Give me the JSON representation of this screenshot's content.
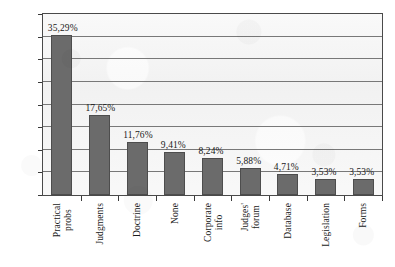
{
  "chart_data": {
    "type": "bar",
    "title": "",
    "subtitle": "",
    "xlabel": "",
    "ylabel": "",
    "ylim": [
      0,
      40
    ],
    "grid": true,
    "legend": false,
    "decimal_separator": ",",
    "value_suffix": "%",
    "categories": [
      "Practical probs",
      "Judgments",
      "Doctrine",
      "None",
      "Corporate info",
      "Judges' forum",
      "Database",
      "Legislation",
      "Forms"
    ],
    "category_lines": [
      [
        "Practical",
        "probs"
      ],
      [
        "Judgments"
      ],
      [
        "Doctrine"
      ],
      [
        "None"
      ],
      [
        "Corporate",
        "info"
      ],
      [
        "Judges'",
        "forum"
      ],
      [
        "Database"
      ],
      [
        "Legislation"
      ],
      [
        "Forms"
      ]
    ],
    "values": [
      35.29,
      17.65,
      11.76,
      9.41,
      8.24,
      5.88,
      4.71,
      3.53,
      3.53
    ],
    "value_labels": [
      "35,29%",
      "17,65%",
      "11,76%",
      "9,41%",
      "8,24%",
      "5,88%",
      "4,71%",
      "3,53%",
      "3,53%"
    ],
    "y_ticks": [
      0,
      5,
      10,
      15,
      20,
      25,
      30,
      35,
      40
    ],
    "y_tick_labels": [
      "0%",
      "5%",
      "10%",
      "15%",
      "20%",
      "25%",
      "30%",
      "35%",
      "40%"
    ],
    "colors": {
      "bar_fill": "#6b6b6b",
      "bar_border": "#4d4d4d",
      "plot_background": "#f2f2f2",
      "gridline": "#787878",
      "axis": "#3a3a3a",
      "text": "#1a1a1a",
      "page_background": "#ffffff"
    }
  }
}
